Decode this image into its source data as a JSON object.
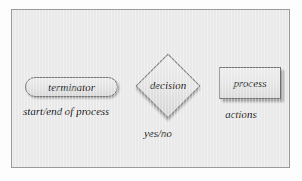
{
  "figure": {
    "type": "flowchart-symbol-legend",
    "background_color": "#e9e9e9",
    "border_color": "#9a9a9a",
    "page_color": "#fdfdfd"
  },
  "shapes": [
    {
      "id": "terminator",
      "shape": "stadium",
      "label": "terminator",
      "caption": "start/end of process",
      "fill": "#e6e6e6",
      "stroke": "#777777"
    },
    {
      "id": "decision",
      "shape": "diamond",
      "label": "decision",
      "caption": "yes/no",
      "fill": "#e4e4e4",
      "stroke": "#7c7c7c"
    },
    {
      "id": "process",
      "shape": "rectangle",
      "label": "process",
      "caption": "actions",
      "fill": "#e5e5e5",
      "stroke": "#6f6f6f"
    }
  ]
}
